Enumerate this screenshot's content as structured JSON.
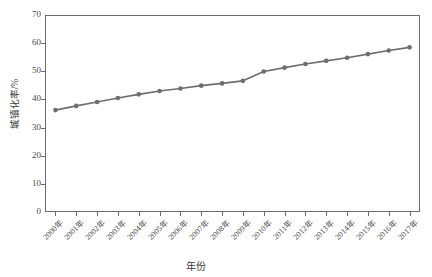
{
  "chart_data": {
    "type": "line",
    "title": "",
    "xlabel": "年份",
    "ylabel": "城镇化率/%",
    "categories": [
      "2000年",
      "2001年",
      "2002年",
      "2003年",
      "2004年",
      "2005年",
      "2006年",
      "2007年",
      "2008年",
      "2009年",
      "2010年",
      "2011年",
      "2012年",
      "2013年",
      "2014年",
      "2015年",
      "2016年",
      "2017年"
    ],
    "x_values": [
      2000,
      2001,
      2002,
      2003,
      2004,
      2005,
      2006,
      2007,
      2008,
      2009,
      2010,
      2011,
      2012,
      2013,
      2014,
      2015,
      2016,
      2017
    ],
    "series": [
      {
        "name": "城镇化率",
        "values": [
          36.2,
          37.7,
          39.1,
          40.5,
          41.8,
          43.0,
          43.9,
          44.9,
          45.7,
          46.6,
          49.9,
          51.3,
          52.6,
          53.7,
          54.8,
          56.1,
          57.4,
          58.5
        ],
        "color": "#6e6e6e",
        "marker": "circle"
      }
    ],
    "y_ticks": [
      0,
      10,
      20,
      30,
      40,
      50,
      60,
      70
    ],
    "ylim": [
      0,
      70
    ],
    "grid": false,
    "legend": false,
    "legend_position": "none",
    "axis_color": "#6d6d6d",
    "background": "#ffffff"
  },
  "axes": {
    "y_title": "城镇化率/%",
    "x_title": "年份",
    "y_tick_labels": [
      "0",
      "10",
      "20",
      "30",
      "40",
      "50",
      "60",
      "70"
    ]
  }
}
